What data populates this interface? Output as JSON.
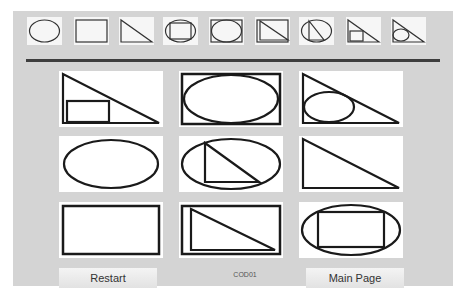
{
  "options": [
    {
      "id": "ellipse",
      "label": "ellipse"
    },
    {
      "id": "rectangle",
      "label": "rectangle"
    },
    {
      "id": "triangle",
      "label": "triangle"
    },
    {
      "id": "rect-in-ellipse",
      "label": "rectangle in ellipse"
    },
    {
      "id": "ellipse-in-rect",
      "label": "ellipse in rectangle"
    },
    {
      "id": "triangle-in-rect",
      "label": "triangle in rectangle"
    },
    {
      "id": "triangle-in-ellipse",
      "label": "triangle in ellipse"
    },
    {
      "id": "rect-in-triangle",
      "label": "rectangle in triangle"
    },
    {
      "id": "ellipse-in-triangle",
      "label": "ellipse in triangle"
    }
  ],
  "grid": [
    {
      "id": "rect-in-triangle"
    },
    {
      "id": "ellipse-in-rect"
    },
    {
      "id": "ellipse-in-triangle"
    },
    {
      "id": "ellipse"
    },
    {
      "id": "triangle-in-ellipse"
    },
    {
      "id": "triangle"
    },
    {
      "id": "rectangle"
    },
    {
      "id": "triangle-in-rect"
    },
    {
      "id": "rect-in-ellipse"
    }
  ],
  "footer": {
    "restart_label": "Restart",
    "code": "COD01",
    "main_page_label": "Main Page"
  },
  "colors": {
    "panel": "#d4d4d4",
    "stroke": "#1a1a1a",
    "separator": "#3e3e3e"
  }
}
